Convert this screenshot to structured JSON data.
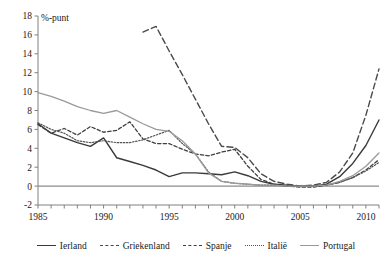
{
  "chart_data": {
    "type": "line",
    "title": "",
    "subtitle": "",
    "xlabel": "",
    "ylabel": "%-punt",
    "unit_label": "%-punt",
    "xlim": [
      1985,
      2011
    ],
    "ylim": [
      -2,
      18
    ],
    "ytick_step": 2,
    "yticks": [
      -2,
      0,
      2,
      4,
      6,
      8,
      10,
      12,
      14,
      16,
      18
    ],
    "ytick_labels": [
      "-2",
      "0",
      "2",
      "4",
      "6",
      "8",
      "10",
      "12",
      "14",
      "16",
      "18"
    ],
    "xticks": [
      1985,
      1986,
      1987,
      1988,
      1989,
      1990,
      1991,
      1992,
      1993,
      1994,
      1995,
      1996,
      1997,
      1998,
      1999,
      2000,
      2001,
      2002,
      2003,
      2004,
      2005,
      2006,
      2007,
      2008,
      2009,
      2010,
      2011
    ],
    "xtick_labels_shown": [
      "1985",
      "1990",
      "1995",
      "2000",
      "2005",
      "2010"
    ],
    "xtick_labels_years": [
      1985,
      1990,
      1995,
      2000,
      2005,
      2010
    ],
    "grid": false,
    "zero_line": true,
    "legend_position": "bottom",
    "series": [
      {
        "name": "Ierland",
        "color": "#3a3a3a",
        "style": "solid",
        "width": 1.4,
        "x": [
          1985,
          1986,
          1987,
          1988,
          1989,
          1990,
          1991,
          1992,
          1993,
          1994,
          1995,
          1996,
          1997,
          1998,
          1999,
          2000,
          2001,
          2002,
          2003,
          2004,
          2005,
          2006,
          2007,
          2008,
          2009,
          2010,
          2011
        ],
        "values": [
          6.6,
          5.6,
          5.1,
          4.6,
          4.2,
          5.1,
          3.0,
          2.6,
          2.2,
          1.7,
          1.0,
          1.4,
          1.4,
          1.3,
          1.2,
          1.5,
          1.1,
          0.5,
          0.2,
          0.1,
          0.0,
          0.0,
          0.2,
          1.0,
          2.4,
          4.3,
          7.0
        ]
      },
      {
        "name": "Griekenland",
        "color": "#4a4a4a",
        "style": "longdash",
        "width": 1.4,
        "x": [
          1993,
          1994,
          1995,
          1996,
          1997,
          1998,
          1999,
          2000,
          2001,
          2002,
          2003,
          2004,
          2005,
          2006,
          2007,
          2008,
          2009,
          2010,
          2011
        ],
        "values": [
          16.3,
          16.9,
          14.3,
          11.8,
          9.2,
          6.6,
          4.2,
          4.1,
          3.0,
          1.3,
          0.5,
          0.2,
          0.0,
          0.1,
          0.4,
          1.5,
          3.5,
          7.5,
          12.4
        ]
      },
      {
        "name": "Spanje",
        "color": "#3f3f3f",
        "style": "dash",
        "width": 1.3,
        "x": [
          1985,
          1986,
          1987,
          1988,
          1989,
          1990,
          1991,
          1992,
          1993,
          1994,
          1995,
          1996,
          1997,
          1998,
          1999,
          2000,
          2001,
          2002,
          2003,
          2004,
          2005,
          2006,
          2007,
          2008,
          2009,
          2010,
          2011
        ],
        "values": [
          6.5,
          5.6,
          6.1,
          5.4,
          6.3,
          5.7,
          5.9,
          6.8,
          5.0,
          4.5,
          4.5,
          3.9,
          3.4,
          3.2,
          3.6,
          3.9,
          2.1,
          0.7,
          0.2,
          0.0,
          -0.1,
          -0.1,
          0.1,
          0.4,
          0.9,
          1.7,
          2.8
        ]
      },
      {
        "name": "Italië",
        "color": "#555555",
        "style": "dot",
        "width": 1.2,
        "x": [
          1985,
          1986,
          1987,
          1988,
          1989,
          1990,
          1991,
          1992,
          1993,
          1994,
          1995,
          1996,
          1997,
          1998,
          1999,
          2000,
          2001,
          2002,
          2003,
          2004,
          2005,
          2006,
          2007,
          2008,
          2009,
          2010,
          2011
        ],
        "values": [
          6.7,
          6.0,
          5.6,
          4.8,
          4.6,
          4.8,
          4.6,
          4.6,
          4.9,
          5.4,
          5.9,
          4.5,
          3.4,
          1.5,
          0.5,
          0.3,
          0.2,
          0.1,
          0.1,
          0.0,
          0.0,
          0.0,
          0.1,
          0.4,
          0.9,
          1.6,
          2.5
        ]
      },
      {
        "name": "Portugal",
        "color": "#9a9a9a",
        "style": "solid",
        "width": 1.3,
        "x": [
          1985,
          1986,
          1987,
          1988,
          1989,
          1990,
          1991,
          1992,
          1993,
          1994,
          1995,
          1996,
          1997,
          1998,
          1999,
          2000,
          2001,
          2002,
          2003,
          2004,
          2005,
          2006,
          2007,
          2008,
          2009,
          2010,
          2011
        ],
        "values": [
          9.9,
          9.5,
          9.0,
          8.4,
          8.0,
          7.7,
          8.0,
          7.3,
          6.6,
          6.0,
          5.8,
          4.8,
          3.4,
          1.4,
          0.5,
          0.3,
          0.2,
          0.1,
          0.1,
          0.0,
          0.0,
          0.0,
          0.1,
          0.5,
          1.1,
          2.1,
          3.5
        ]
      }
    ]
  },
  "legend": {
    "items": [
      {
        "label": "Ierland"
      },
      {
        "label": "Griekenland"
      },
      {
        "label": "Spanje"
      },
      {
        "label": "Italië"
      },
      {
        "label": "Portugal"
      }
    ]
  }
}
